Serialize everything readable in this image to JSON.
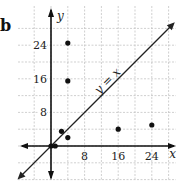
{
  "panel_label": "b",
  "chart_data": {
    "type": "scatter",
    "title": "",
    "xlabel": "x",
    "ylabel": "y",
    "xlim": [
      -8,
      28
    ],
    "ylim": [
      -8,
      28
    ],
    "grid": true,
    "x_ticks": [
      8,
      16,
      24
    ],
    "y_ticks": [
      8,
      16,
      24
    ],
    "reference_line": {
      "label": "y = x",
      "slope": 1,
      "intercept": 0
    },
    "points": [
      {
        "x": 0,
        "y": 0
      },
      {
        "x": 1,
        "y": 0
      },
      {
        "x": 2.5,
        "y": 3.5
      },
      {
        "x": 4,
        "y": 2
      },
      {
        "x": 4,
        "y": 15.5
      },
      {
        "x": 4,
        "y": 24.5
      },
      {
        "x": 16,
        "y": 4
      },
      {
        "x": 24,
        "y": 5
      }
    ]
  }
}
